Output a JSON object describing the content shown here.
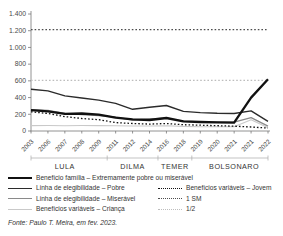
{
  "chart_data": {
    "type": "line",
    "x_labels": [
      "2003",
      "2006",
      "2007",
      "2008",
      "2009",
      "2011",
      "2012",
      "2014",
      "2016",
      "2018",
      "2019",
      "2020",
      "2021",
      "2021",
      "2022"
    ],
    "ylim": [
      0,
      1400
    ],
    "y_tick_values": [
      0,
      200,
      400,
      600,
      800,
      1000,
      1200,
      1400
    ],
    "y_ticks": [
      "0",
      "200",
      "400",
      "600",
      "800",
      "1.000",
      "1.200",
      "1.400"
    ],
    "grid": false,
    "legend_position": "bottom",
    "series": [
      {
        "id": "um-sm",
        "name": "1 SM",
        "style": {
          "color": "#4d4d4d",
          "width": 1.2,
          "dash": "1.6 2"
        },
        "values": [
          1212,
          1212,
          1212,
          1212,
          1212,
          1212,
          1212,
          1212,
          1212,
          1212,
          1212,
          1212,
          1212,
          1212,
          1212
        ]
      },
      {
        "id": "meio-sm",
        "name": "1/2",
        "style": {
          "color": "#bdbdbd",
          "width": 1.2,
          "dash": "1.6 2"
        },
        "values": [
          606,
          606,
          606,
          606,
          606,
          606,
          606,
          606,
          606,
          606,
          606,
          606,
          606,
          606,
          606
        ]
      },
      {
        "id": "beneficios-variaveis-crianca",
        "name": "Benefícios variáveis – Criança",
        "style": {
          "color": "#c9c9c9",
          "width": 1.1,
          "dash": null
        },
        "values": [
          65,
          66,
          64,
          66,
          65,
          62,
          60,
          60,
          64,
          55,
          52,
          50,
          50,
          135,
          40
        ]
      },
      {
        "id": "linha-elegibilidade-miseravel",
        "name": "Linha de elegibilidade – Miserável",
        "style": {
          "color": "#8a8a8a",
          "width": 1.3,
          "dash": null
        },
        "values": [
          255,
          245,
          212,
          198,
          186,
          166,
          131,
          143,
          153,
          118,
          110,
          106,
          105,
          160,
          58
        ]
      },
      {
        "id": "linha-elegibilidade-pobre",
        "name": "Linha de elegibilidade – Pobre",
        "style": {
          "color": "#2b2b2b",
          "width": 1.4,
          "dash": null
        },
        "values": [
          500,
          480,
          420,
          395,
          370,
          330,
          260,
          285,
          305,
          235,
          220,
          212,
          210,
          240,
          115
        ]
      },
      {
        "id": "beneficios-variaveis-jovem",
        "name": "Benefícios variáveis – Jovem",
        "style": {
          "color": "#111111",
          "width": 1.3,
          "dash": "1.6 2"
        },
        "values": [
          230,
          210,
          172,
          150,
          135,
          100,
          90,
          82,
          90,
          75,
          70,
          64,
          58,
          48,
          35
        ]
      },
      {
        "id": "beneficio-familia",
        "name": "Benefício família – Extremamente pobre ou miserável",
        "style": {
          "color": "#111111",
          "width": 2.3,
          "dash": null
        },
        "values": [
          250,
          235,
          205,
          210,
          195,
          160,
          140,
          132,
          155,
          115,
          108,
          104,
          100,
          400,
          620
        ]
      }
    ],
    "periods": [
      {
        "label": "LULA",
        "from": 0,
        "to": 4
      },
      {
        "label": "DILMA",
        "from": 5,
        "to": 7
      },
      {
        "label": "TEMER",
        "from": 8,
        "to": 9
      },
      {
        "label": "BOLSONARO",
        "from": 10,
        "to": 14
      }
    ]
  },
  "legend": {
    "items": [
      {
        "label": "Benefício família – Extremamente pobre ou miserável",
        "swatch": {
          "color": "#111111",
          "thickness": 2.5,
          "dashed": false
        }
      },
      {
        "label": "Linha de elegibilidade – Pobre",
        "swatch": {
          "color": "#2b2b2b",
          "thickness": 1.6,
          "dashed": false
        }
      },
      {
        "label": "Benefícios variáveis – Jovem",
        "swatch": {
          "color": "#111111",
          "thickness": 1.4,
          "dashed": true
        }
      },
      {
        "label": "Linha de elegibilidade – Miserável",
        "swatch": {
          "color": "#8a8a8a",
          "thickness": 1.6,
          "dashed": false
        }
      },
      {
        "label": "1 SM",
        "swatch": {
          "color": "#4d4d4d",
          "thickness": 1.4,
          "dashed": true
        }
      },
      {
        "label": "Benefícios variáveis – Criança",
        "swatch": {
          "color": "#c9c9c9",
          "thickness": 1.4,
          "dashed": false
        }
      },
      {
        "label": "1/2",
        "swatch": {
          "color": "#bdbdbd",
          "thickness": 1.4,
          "dashed": true
        }
      }
    ]
  },
  "footer": {
    "source": "Fonte: Paulo T. Meira, em fev. 2023."
  }
}
